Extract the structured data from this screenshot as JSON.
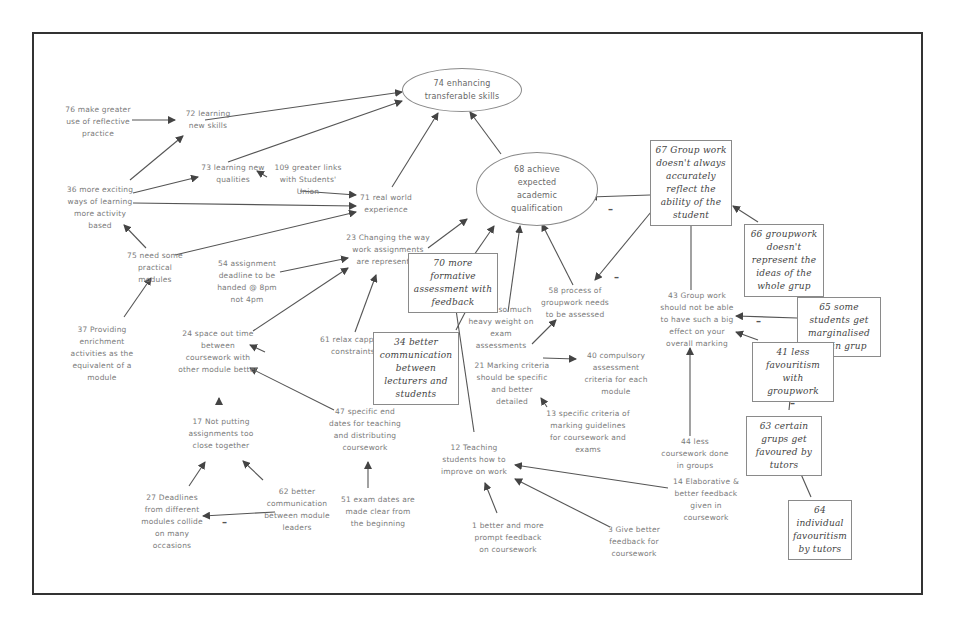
{
  "diagram": {
    "type": "cognitive-map",
    "goals": [
      {
        "id": "74",
        "label": "74 enhancing transferable skills"
      },
      {
        "id": "68",
        "label": "68 achieve expected academic qualification"
      }
    ],
    "nodes": {
      "n76": "76 make greater use of reflective practice",
      "n72": "72 learning new skills",
      "n73": "73 learning new qualities",
      "n109": "109 greater links with Students' Union",
      "n36": "36 more exciting ways of learning more activity based",
      "n71": "71 real world experience",
      "n75": "75 need some practical modules",
      "n37": "37 Providing enrichment activities as the equivalent of a module",
      "n23": "23 Changing the way work assignments are represented",
      "n54": "54 assignment deadline to be handed @ 8pm not 4pm",
      "n24": "24 space out time between coursework with other module better",
      "n61": "61 relax capping constraints",
      "n17": "17 Not putting assignments too close together",
      "n47": "47 specific end dates for teaching and distributing coursework",
      "n27": "27 Deadlines from different modules collide on many occasions",
      "n62": "62 better communication between module leaders",
      "n51": "51 exam dates are made clear from the beginning",
      "n70": "70 more formative assessment with feedback",
      "n34": "34 better communication between lecturers and students",
      "n11": "11 not so much heavy weight on exam assessments",
      "n58": "58 process of groupwork needs to be assessed",
      "n21": "21 Marking criteria should be specific and better detailed",
      "n40": "40 compulsory assessment criteria for each module",
      "n13": "13 specific criteria of marking guidelines for coursework and exams",
      "n12": "12 Teaching students how to improve on work",
      "n1": "1 better and more prompt feedback on coursework",
      "n3": "3 Give better feedback for coursework",
      "n14": "14 Elaborative & better feedback given in coursework",
      "n67": "67 Group work doesn't always accurately reflect the ability of the student",
      "n66": "66 groupwork doesn't represent the ideas of the whole grup",
      "n43": "43 Group work should not be able to have such a big effect on your overall marking",
      "n65": "65 some students get marginalised within grup",
      "n41": "41 less favouritism with groupwork",
      "n44": "44 less coursework done in groups",
      "n63": "63 certain grups get favoured by tutors",
      "n64": "64 individual favouritism by tutors"
    },
    "negative_sign": "–",
    "colors": {
      "frame": "#333333",
      "edge": "#555555",
      "text": "#7a7a7a",
      "box_text": "#444444"
    }
  }
}
